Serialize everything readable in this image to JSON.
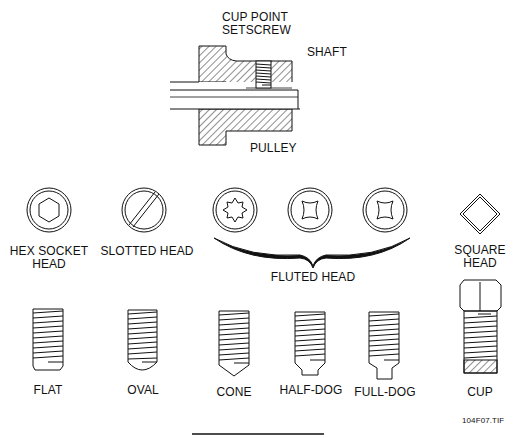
{
  "figure": {
    "id_label": "104F07.TIF"
  },
  "assembly": {
    "setscrew_label_line1": "CUP POINT",
    "setscrew_label_line2": "SETSCREW",
    "shaft_label": "SHAFT",
    "pulley_label": "PULLEY"
  },
  "heads": {
    "hex_socket_line1": "HEX SOCKET",
    "hex_socket_line2": "HEAD",
    "slotted": "SLOTTED HEAD",
    "fluted": "FLUTED HEAD",
    "square_line1": "SQUARE",
    "square_line2": "HEAD"
  },
  "points": [
    {
      "label": "FLAT"
    },
    {
      "label": "OVAL"
    },
    {
      "label": "CONE"
    },
    {
      "label": "HALF-DOG"
    },
    {
      "label": "FULL-DOG"
    },
    {
      "label": "CUP"
    }
  ]
}
